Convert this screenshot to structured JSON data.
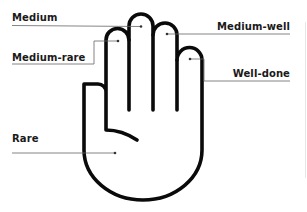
{
  "diagram": {
    "labels": [
      {
        "id": "medium",
        "text": "Medium",
        "target": "middle-finger"
      },
      {
        "id": "medium-rare",
        "text": "Medium-rare",
        "target": "index-finger"
      },
      {
        "id": "medium-well",
        "text": "Medium-well",
        "target": "ring-finger"
      },
      {
        "id": "well-done",
        "text": "Well-done",
        "target": "pinky-finger"
      },
      {
        "id": "rare",
        "text": "Rare",
        "target": "palm"
      }
    ],
    "colors": {
      "outline": "#0a0a0a",
      "leader": "#555555",
      "text": "#1a1a1a",
      "background": "#ffffff"
    }
  }
}
